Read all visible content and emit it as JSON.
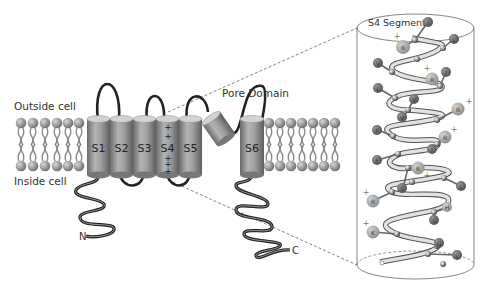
{
  "diagram": {
    "labels": {
      "outside": "Outside cell",
      "inside": "Inside cell",
      "pore_domain": "Pore Domain",
      "n_terminus": "N",
      "c_terminus": "C",
      "s4_segment": "S4 Segment"
    },
    "segments": [
      {
        "id": "S1",
        "label": "S1"
      },
      {
        "id": "S2",
        "label": "S2"
      },
      {
        "id": "S3",
        "label": "S3"
      },
      {
        "id": "S4",
        "label": "S4"
      },
      {
        "id": "S5",
        "label": "S5"
      },
      {
        "id": "S6",
        "label": "S6"
      }
    ],
    "s4_charges": [
      "+",
      "+",
      "+",
      "+",
      "+"
    ],
    "helix_residues": [
      {
        "label": "I",
        "charge": ""
      },
      {
        "label": "L",
        "charge": ""
      },
      {
        "label": "R",
        "charge": "+"
      },
      {
        "label": "V",
        "charge": ""
      },
      {
        "label": "R",
        "charge": "+"
      },
      {
        "label": "I",
        "charge": ""
      },
      {
        "label": "L",
        "charge": ""
      },
      {
        "label": "V",
        "charge": ""
      },
      {
        "label": "V",
        "charge": ""
      },
      {
        "label": "R",
        "charge": "+"
      },
      {
        "label": "F",
        "charge": ""
      },
      {
        "label": "R",
        "charge": "+"
      },
      {
        "label": "I",
        "charge": ""
      },
      {
        "label": "F",
        "charge": ""
      },
      {
        "label": "R",
        "charge": "+"
      },
      {
        "label": "S",
        "charge": ""
      },
      {
        "label": "L",
        "charge": ""
      },
      {
        "label": "R",
        "charge": "+"
      },
      {
        "label": "H",
        "charge": ""
      },
      {
        "label": "S",
        "charge": ""
      },
      {
        "label": "K",
        "charge": "+"
      },
      {
        "label": "G",
        "charge": ""
      },
      {
        "label": "L",
        "charge": ""
      }
    ],
    "colors": {
      "cylinder": "#9a9a9a",
      "cylinder_top": "#d0d0d0",
      "lipid_head": "#8c8c8c",
      "loop": "#2a2a2a",
      "charged_residue": "#a8a8a8",
      "neutral_residue": "#6e6e6e"
    }
  }
}
